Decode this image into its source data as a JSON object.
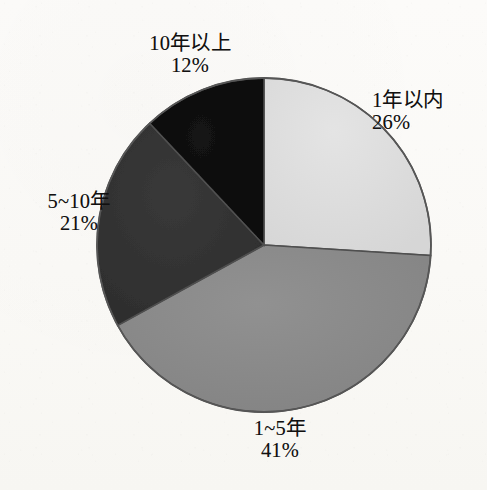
{
  "chart_data": {
    "type": "pie",
    "title": "",
    "subtitle": "",
    "xlabel": "",
    "ylabel": "",
    "grid": false,
    "legend_position": "none",
    "label_format": "name + percent",
    "start_angle_deg": 0,
    "direction": "clockwise",
    "categories": [
      "1年以内",
      "1~5年",
      "5~10年",
      "10年以上"
    ],
    "values": [
      26,
      41,
      21,
      12
    ],
    "unit": "%",
    "slices": [
      {
        "name": "1年以内",
        "value": 26,
        "value_label": "26%",
        "color": "#dedede",
        "start_deg": 0,
        "end_deg": 93.6,
        "label_position": "right"
      },
      {
        "name": "1~5年",
        "value": 41,
        "value_label": "41%",
        "color": "#8a8a8a",
        "start_deg": 93.6,
        "end_deg": 241.2,
        "label_position": "bottom"
      },
      {
        "name": "5~10年",
        "value": 21,
        "value_label": "21%",
        "color": "#333333",
        "start_deg": 241.2,
        "end_deg": 316.8,
        "label_position": "left"
      },
      {
        "name": "10年以上",
        "value": 12,
        "value_label": "12%",
        "color": "#0d0d0d",
        "start_deg": 316.8,
        "end_deg": 360,
        "label_position": "top"
      }
    ]
  },
  "labels": {
    "within1": {
      "name": "1年以内",
      "pct": "26%"
    },
    "one_to_five": {
      "name": "1~5年",
      "pct": "41%"
    },
    "five_to_ten": {
      "name": "5~10年",
      "pct": "21%"
    },
    "over_ten": {
      "name": "10年以上",
      "pct": "12%"
    }
  },
  "geometry": {
    "center_x": 264,
    "center_y": 245,
    "radius": 167
  },
  "colors": {
    "background": "#fbfaf7",
    "outline": "#4a4a4a",
    "text": "#111010",
    "slice_within1": "#dedede",
    "slice_one_to_five": "#8a8a8a",
    "slice_five_to_ten": "#333333",
    "slice_over_ten": "#0d0d0d"
  }
}
